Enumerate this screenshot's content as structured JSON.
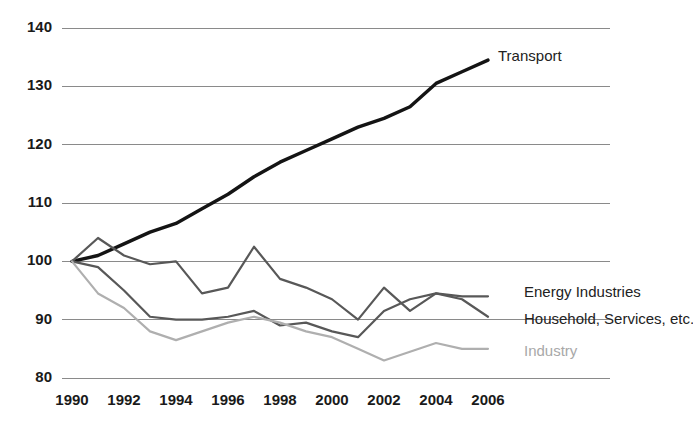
{
  "chart_data": {
    "type": "line",
    "title": "",
    "subtitle": "",
    "xlabel": "",
    "ylabel": "",
    "xlim": [
      1990,
      2006
    ],
    "ylim": [
      80,
      140
    ],
    "grid": true,
    "legend_position": "right-inline",
    "y_ticks": [
      140,
      130,
      120,
      110,
      100,
      90,
      80
    ],
    "x_ticks": [
      1990,
      1992,
      1994,
      1996,
      1998,
      2000,
      2002,
      2004,
      2006
    ],
    "x": [
      1990,
      1991,
      1992,
      1993,
      1994,
      1995,
      1996,
      1997,
      1998,
      1999,
      2000,
      2001,
      2002,
      2003,
      2004,
      2005,
      2006
    ],
    "series": [
      {
        "name": "Transport",
        "color": "#141414",
        "width": 3.4,
        "label_x": 1990,
        "values": [
          100.0,
          101.0,
          103.0,
          105.0,
          106.5,
          109.0,
          111.5,
          114.5,
          117.0,
          119.0,
          121.0,
          123.0,
          124.5,
          126.5,
          130.5,
          132.5,
          134.5
        ]
      },
      {
        "name": "Energy Industries",
        "color": "#585858",
        "width": 2.2,
        "label_x": 2006,
        "values": [
          100.0,
          104.0,
          101.0,
          99.5,
          100.0,
          94.5,
          95.5,
          102.5,
          97.0,
          95.5,
          93.5,
          90.0,
          95.5,
          91.5,
          94.5,
          94.0,
          94.0
        ]
      },
      {
        "name": "Household, Services, etc.",
        "color": "#585858",
        "width": 2.2,
        "label_x": 2006,
        "values": [
          100.0,
          99.0,
          95.0,
          90.5,
          90.0,
          90.0,
          90.5,
          91.5,
          89.0,
          89.5,
          88.0,
          87.0,
          91.5,
          93.5,
          94.5,
          93.5,
          90.5
        ]
      },
      {
        "name": "Industry",
        "color": "#afafaf",
        "width": 2.2,
        "label_x": 2006,
        "values": [
          100.0,
          94.5,
          92.0,
          88.0,
          86.5,
          88.0,
          89.5,
          90.5,
          89.5,
          88.0,
          87.0,
          85.0,
          83.0,
          84.5,
          86.0,
          85.0,
          85.0
        ]
      }
    ],
    "annotations": [
      {
        "text": "Transport",
        "value": 135.0,
        "style": "dark"
      },
      {
        "text": "Energy Industries",
        "value": 94.5,
        "style": "dark"
      },
      {
        "text": "Household, Services, etc.",
        "value": 90.0,
        "style": "dark"
      },
      {
        "text": "Industry",
        "value": 84.5,
        "style": "light"
      }
    ]
  }
}
